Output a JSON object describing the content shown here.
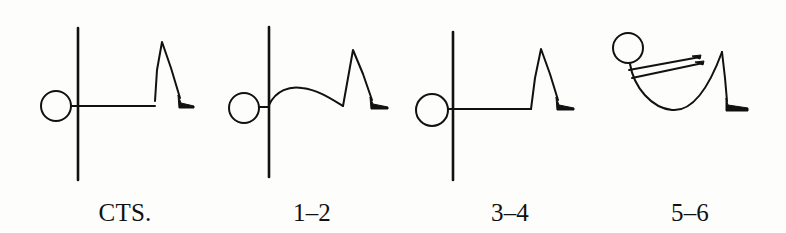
{
  "figure": {
    "colors": {
      "ink": "#111111",
      "paper": "#fdfdfc"
    },
    "panels": [
      {
        "id": "cts",
        "caption": "CTS.",
        "pose": "lying flat, arms overhead, one knee bent",
        "caption_x": 125
      },
      {
        "id": "1-2",
        "caption": "1–2",
        "pose": "lying, arms raised, back arching",
        "caption_x": 312
      },
      {
        "id": "3-4",
        "caption": "3–4",
        "pose": "lying flat, arms overhead, one knee bent",
        "caption_x": 510
      },
      {
        "id": "5-6",
        "caption": "5–6",
        "pose": "curled up, arms reaching forward toward knee",
        "caption_x": 690
      }
    ]
  }
}
